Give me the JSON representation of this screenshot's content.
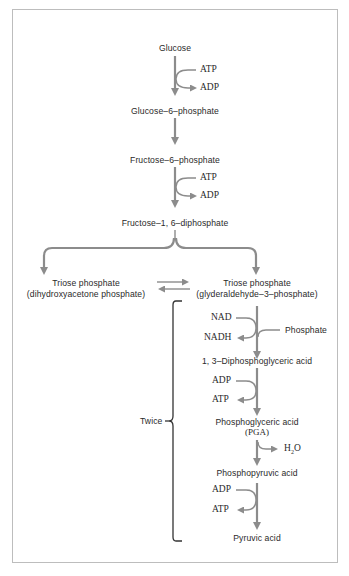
{
  "diagram": {
    "colors": {
      "arrow": "#8c8c8c",
      "text": "#2a2a2a",
      "frame": "#bdbdbd",
      "brace": "#333333"
    },
    "nodes": {
      "glucose": "Glucose",
      "g6p": "Glucose–6–phosphate",
      "f6p": "Fructose–6–phosphate",
      "f16dp": "Fructose–1, 6–diphosphate",
      "triose_left_1": "Triose phosphate",
      "triose_left_2": "(dihydroxyacetone phosphate)",
      "triose_right_1": "Triose phosphate",
      "triose_right_2": "(glyderaldehyde–3–phosphate)",
      "dpg": "1, 3–Diphosphoglyceric acid",
      "pga_1": "Phosphoglyceric acid",
      "pga_2": "(PGA)",
      "pep": "Phosphopyruvic acid",
      "pyruvate": "Pyruvic acid"
    },
    "side": {
      "atp1": "ATP",
      "adp1": "ADP",
      "atp2": "ATP",
      "adp2": "ADP",
      "nad": "NAD",
      "nadh": "NADH",
      "phosphate": "Phosphate",
      "adp3": "ADP",
      "atp3": "ATP",
      "h2o_h": "H",
      "h2o_sub": "2",
      "h2o_o": "O",
      "adp4": "ADP",
      "atp4": "ATP"
    },
    "brace_label": "Twice"
  }
}
